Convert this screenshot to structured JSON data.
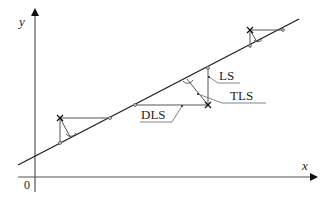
{
  "diagram": {
    "type": "regression-illustration",
    "axes": {
      "x_label": "x",
      "y_label": "y",
      "origin_label": "0"
    },
    "labels": {
      "ls": "LS",
      "tls": "TLS",
      "dls": "DLS"
    },
    "legend_meaning": {
      "LS": "vertical residual (ordinary least squares)",
      "TLS": "perpendicular residual (total least squares)",
      "DLS": "horizontal residual"
    },
    "colors": {
      "axis": "#555555",
      "line": "#222222",
      "residual": "#555555",
      "text": "#222222"
    },
    "points": [
      {
        "name": "point-1",
        "x": 60,
        "y": 118
      },
      {
        "name": "point-2",
        "x": 208,
        "y": 105
      },
      {
        "name": "point-3",
        "x": 250,
        "y": 30
      }
    ]
  }
}
